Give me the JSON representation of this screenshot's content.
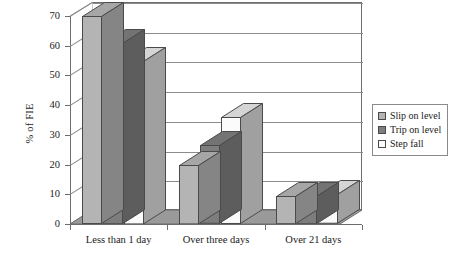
{
  "chart_data": {
    "type": "bar",
    "title": "",
    "subtitle": "",
    "xlabel": "",
    "ylabel": "% of FIE",
    "categories": [
      "Less than 1 day",
      "Over three days",
      "Over 21 days"
    ],
    "series": [
      {
        "name": "Slip on level",
        "color": "#b4b4b4",
        "values": [
          70,
          20,
          9.5
        ]
      },
      {
        "name": "Trip on level",
        "color": "#7d7d7d",
        "values": [
          61,
          26.5,
          9.5
        ]
      },
      {
        "name": "Step fall",
        "color": "#fbfbfb",
        "values": [
          55,
          36,
          10
        ]
      }
    ],
    "ylim": [
      0,
      70
    ],
    "yticks": [
      0,
      10,
      20,
      30,
      40,
      50,
      60,
      70
    ],
    "ytick_labels": [
      "0",
      "10",
      "20",
      "30",
      "40",
      "50",
      "60",
      "70"
    ],
    "grid": true,
    "legend_position": "right",
    "style": "3d-columns",
    "annotations": []
  },
  "legend": {
    "entries": [
      {
        "label": "Slip on level",
        "swatch": "#b4b4b4"
      },
      {
        "label": "Trip on level",
        "swatch": "#7d7d7d"
      },
      {
        "label": "Step fall",
        "swatch": "#fbfbfb"
      }
    ]
  },
  "colors": {
    "series_light": "#b4b4b4",
    "series_dark": "#7d7d7d",
    "series_white": "#fbfbfb",
    "floor": "#9a9a9a",
    "wall_line": "#8c8c8c",
    "axis": "#6d6d6d",
    "text": "#1a1a1a",
    "background": "#ffffff"
  }
}
